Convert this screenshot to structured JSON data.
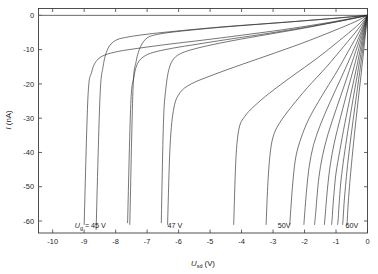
{
  "figure": {
    "name": "transistor-output-characteristics",
    "background_color": "#ffffff",
    "line_color": "#2b2b2b",
    "axis_color": "#3c3c3c"
  },
  "chart_data": {
    "type": "line",
    "title": "",
    "subtitle": "",
    "xlabel": "U_sd (V)",
    "ylabel": "I (nA)",
    "xlabel_parts": {
      "symbol": "U",
      "subscript": "sd",
      "unit": "(V)"
    },
    "ylabel_parts": {
      "symbol": "I",
      "unit": "(nA)"
    },
    "xlim": [
      -10.45,
      0.0
    ],
    "ylim": [
      -63.5,
      2.0
    ],
    "xticks": [
      -10,
      -9,
      -8,
      -7,
      -6,
      -5,
      -4,
      -3,
      -2,
      -1,
      0
    ],
    "xtick_labels": [
      "-10",
      "-9",
      "-8",
      "-7",
      "-6",
      "-5",
      "-4",
      "-3",
      "-2",
      "-1",
      "0"
    ],
    "yticks": [
      0,
      -10,
      -20,
      -30,
      -40,
      -50,
      -60
    ],
    "ytick_labels": [
      "0",
      "-10",
      "-20",
      "-30",
      "-40",
      "-50",
      "-60"
    ],
    "grid": false,
    "legend": "none",
    "zero_reference_line": {
      "y": 0,
      "label": "zero-current-line",
      "color": "#6a6a6a"
    },
    "annotations": [
      {
        "name": "annotation-ug-45v",
        "text": "U_g = 45 V",
        "symbol": "U",
        "subscript": "g",
        "rest": " = 45 V",
        "x": -9.3,
        "y": -62.0
      },
      {
        "name": "annotation-47v",
        "text": "47 V",
        "symbol": "",
        "subscript": "",
        "rest": "47 V",
        "x": -6.35,
        "y": -62.0
      },
      {
        "name": "annotation-50v",
        "text": "50V",
        "symbol": "",
        "subscript": "",
        "rest": "50V",
        "x": -2.85,
        "y": -62.0
      },
      {
        "name": "annotation-60v",
        "text": "60V",
        "symbol": "",
        "subscript": "",
        "rest": "60V",
        "x": -0.7,
        "y": -62.0
      }
    ],
    "series_parameter": {
      "name": "U_g",
      "unit": "V",
      "from": 45,
      "to": 60,
      "step": 1,
      "count": 16
    },
    "series": [
      {
        "name": "Ug = 45 V",
        "ug": 45,
        "v_knee": -7.55,
        "i_sat": -6.0,
        "x": [
          0.0,
          -0.4,
          -1.0,
          -1.8,
          -2.8,
          -3.8,
          -4.8,
          -5.6,
          -6.2,
          -6.7,
          -7.0,
          -7.2,
          -7.35,
          -7.45,
          -7.55
        ],
        "y": [
          0.0,
          -0.35,
          -0.85,
          -1.45,
          -2.15,
          -2.85,
          -3.6,
          -4.3,
          -4.9,
          -5.6,
          -6.6,
          -9.0,
          -13.5,
          -22.0,
          -61.0
        ]
      },
      {
        "name": "Ug = 46 V",
        "ug": 46,
        "v_knee": -8.6,
        "i_sat": -6.9,
        "x": [
          0.0,
          -0.5,
          -1.2,
          -2.2,
          -3.2,
          -4.4,
          -5.4,
          -6.3,
          -7.0,
          -7.6,
          -8.0,
          -8.25,
          -8.4,
          -8.5,
          -8.62
        ],
        "y": [
          0.0,
          -0.4,
          -0.95,
          -1.7,
          -2.4,
          -3.2,
          -4.0,
          -4.8,
          -5.5,
          -6.3,
          -7.3,
          -9.8,
          -15.0,
          -24.5,
          -62.5
        ]
      },
      {
        "name": "Ug = 47 V",
        "ug": 47,
        "v_knee": -6.55,
        "i_sat": -11.5,
        "x": [
          0.0,
          -0.45,
          -1.1,
          -2.0,
          -3.0,
          -4.0,
          -4.9,
          -5.5,
          -5.9,
          -6.15,
          -6.3,
          -6.4,
          -6.48,
          -6.55
        ],
        "y": [
          0.0,
          -0.9,
          -2.1,
          -3.7,
          -5.3,
          -6.9,
          -8.5,
          -9.8,
          -11.0,
          -12.6,
          -15.5,
          -21.0,
          -31.0,
          -60.5
        ]
      },
      {
        "name": "Ug = 48 V",
        "ug": 48,
        "v_knee": -7.6,
        "i_sat": -12.5,
        "x": [
          0.0,
          -0.5,
          -1.3,
          -2.3,
          -3.4,
          -4.5,
          -5.4,
          -6.2,
          -6.8,
          -7.1,
          -7.3,
          -7.42,
          -7.52,
          -7.62
        ],
        "y": [
          0.0,
          -1.0,
          -2.4,
          -4.0,
          -5.6,
          -7.1,
          -8.4,
          -9.6,
          -10.8,
          -12.0,
          -14.0,
          -18.0,
          -26.0,
          -60.5
        ]
      },
      {
        "name": "Ug = 49 V",
        "ug": 49,
        "v_knee": -9.0,
        "i_sat": -13.2,
        "x": [
          0.0,
          -0.6,
          -1.5,
          -2.7,
          -4.0,
          -5.2,
          -6.3,
          -7.2,
          -7.9,
          -8.35,
          -8.6,
          -8.76,
          -8.88,
          -9.0
        ],
        "y": [
          0.0,
          -1.05,
          -2.5,
          -4.2,
          -5.8,
          -7.2,
          -8.4,
          -9.5,
          -10.5,
          -11.6,
          -13.2,
          -16.5,
          -24.0,
          -61.0
        ]
      },
      {
        "name": "Ug = 50 V",
        "ug": 50,
        "v_knee": -6.35,
        "i_sat": -22.0,
        "x": [
          0.0,
          -0.4,
          -1.1,
          -2.1,
          -3.2,
          -4.2,
          -5.0,
          -5.6,
          -5.95,
          -6.15,
          -6.27,
          -6.35
        ],
        "y": [
          0.0,
          -1.9,
          -4.6,
          -8.2,
          -11.8,
          -15.0,
          -17.7,
          -20.0,
          -22.5,
          -27.0,
          -38.0,
          -61.0
        ]
      },
      {
        "name": "Ug = 51 V",
        "ug": 51,
        "v_knee": -4.25,
        "i_sat": -31.0,
        "x": [
          0.0,
          -0.35,
          -0.9,
          -1.6,
          -2.4,
          -3.1,
          -3.6,
          -3.9,
          -4.08,
          -4.18,
          -4.25
        ],
        "y": [
          0.0,
          -3.2,
          -7.4,
          -12.5,
          -17.8,
          -22.6,
          -26.5,
          -29.5,
          -33.0,
          -42.0,
          -61.0
        ]
      },
      {
        "name": "Ug = 52 V",
        "ug": 52,
        "v_knee": -3.2,
        "i_sat": -34.0,
        "x": [
          0.0,
          -0.3,
          -0.75,
          -1.3,
          -1.9,
          -2.4,
          -2.8,
          -3.0,
          -3.1,
          -3.17,
          -3.22
        ],
        "y": [
          0.0,
          -4.0,
          -9.0,
          -15.0,
          -21.0,
          -26.5,
          -31.5,
          -35.5,
          -41.0,
          -50.0,
          -61.0
        ]
      },
      {
        "name": "Ug = 53 V",
        "ug": 53,
        "v_knee": -2.45,
        "i_sat": -36.0,
        "x": [
          0.0,
          -0.25,
          -0.6,
          -1.0,
          -1.45,
          -1.85,
          -2.1,
          -2.27,
          -2.36,
          -2.42,
          -2.47
        ],
        "y": [
          0.0,
          -4.6,
          -10.3,
          -16.8,
          -23.5,
          -30.0,
          -35.5,
          -41.0,
          -47.5,
          -54.5,
          -61.0
        ]
      },
      {
        "name": "Ug = 54 V",
        "ug": 54,
        "v_knee": -2.0,
        "i_sat": -38.0,
        "x": [
          0.0,
          -0.22,
          -0.5,
          -0.85,
          -1.2,
          -1.5,
          -1.72,
          -1.85,
          -1.93,
          -1.98,
          -2.02
        ],
        "y": [
          0.0,
          -5.2,
          -11.3,
          -18.5,
          -25.5,
          -32.0,
          -38.0,
          -44.0,
          -50.5,
          -56.0,
          -61.0
        ]
      },
      {
        "name": "Ug = 55 V",
        "ug": 55,
        "v_knee": -1.65,
        "i_sat": -40.0,
        "x": [
          0.0,
          -0.2,
          -0.44,
          -0.72,
          -1.0,
          -1.25,
          -1.43,
          -1.54,
          -1.6,
          -1.64,
          -1.68
        ],
        "y": [
          0.0,
          -5.7,
          -12.3,
          -20.0,
          -27.5,
          -34.5,
          -41.0,
          -47.0,
          -52.5,
          -57.0,
          -61.0
        ]
      },
      {
        "name": "Ug = 56 V",
        "ug": 56,
        "v_knee": -1.35,
        "i_sat": -42.0,
        "x": [
          0.0,
          -0.18,
          -0.38,
          -0.62,
          -0.85,
          -1.05,
          -1.18,
          -1.26,
          -1.31,
          -1.34,
          -1.37
        ],
        "y": [
          0.0,
          -6.2,
          -13.4,
          -21.5,
          -29.5,
          -37.0,
          -43.5,
          -49.5,
          -54.5,
          -58.0,
          -61.0
        ]
      },
      {
        "name": "Ug = 57 V",
        "ug": 57,
        "v_knee": -1.12,
        "i_sat": -44.0,
        "x": [
          0.0,
          -0.16,
          -0.33,
          -0.53,
          -0.72,
          -0.88,
          -1.0,
          -1.06,
          -1.1,
          -1.12,
          -1.14
        ],
        "y": [
          0.0,
          -6.8,
          -14.5,
          -23.0,
          -31.5,
          -39.5,
          -46.0,
          -51.5,
          -56.0,
          -59.0,
          -61.0
        ]
      },
      {
        "name": "Ug = 58 V",
        "ug": 58,
        "v_knee": -0.93,
        "i_sat": -46.0,
        "x": [
          0.0,
          -0.14,
          -0.29,
          -0.46,
          -0.62,
          -0.75,
          -0.84,
          -0.89,
          -0.915,
          -0.93,
          -0.95
        ],
        "y": [
          0.0,
          -7.3,
          -15.6,
          -24.5,
          -33.5,
          -41.5,
          -48.0,
          -53.5,
          -57.0,
          -59.5,
          -61.0
        ]
      },
      {
        "name": "Ug = 59 V",
        "ug": 59,
        "v_knee": -0.78,
        "i_sat": -48.0,
        "x": [
          0.0,
          -0.12,
          -0.25,
          -0.39,
          -0.52,
          -0.63,
          -0.7,
          -0.745,
          -0.765,
          -0.78,
          -0.79
        ],
        "y": [
          0.0,
          -7.9,
          -16.7,
          -26.0,
          -35.0,
          -43.5,
          -50.0,
          -55.0,
          -58.0,
          -60.0,
          -61.0
        ]
      },
      {
        "name": "Ug = 60 V",
        "ug": 60,
        "v_knee": -0.65,
        "i_sat": -50.0,
        "x": [
          0.0,
          -0.1,
          -0.21,
          -0.33,
          -0.44,
          -0.53,
          -0.585,
          -0.62,
          -0.635,
          -0.645,
          -0.655
        ],
        "y": [
          0.0,
          -8.5,
          -17.8,
          -27.5,
          -37.0,
          -45.5,
          -51.5,
          -56.0,
          -58.5,
          -60.2,
          -61.2
        ]
      }
    ]
  }
}
